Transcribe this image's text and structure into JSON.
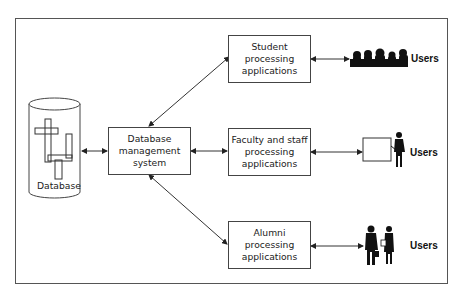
{
  "diagram": {
    "database": {
      "label": "Database"
    },
    "dbms": {
      "label": "Database\nmanagement\nsystem"
    },
    "applications": [
      {
        "id": "student",
        "label": "Student\nprocessing\napplications",
        "users_label": "Users",
        "users_icon": "student-group-silhouette-icon"
      },
      {
        "id": "faculty",
        "label": "Faculty and staff\nprocessing\napplications",
        "users_label": "Users",
        "users_icon": "teacher-at-board-silhouette-icon"
      },
      {
        "id": "alumni",
        "label": "Alumni\nprocessing\napplications",
        "users_label": "Users",
        "users_icon": "business-people-silhouette-icon"
      }
    ],
    "colors": {
      "line": "#333333",
      "box_border": "#444444",
      "silhouette": "#111111",
      "background": "#ffffff"
    }
  }
}
